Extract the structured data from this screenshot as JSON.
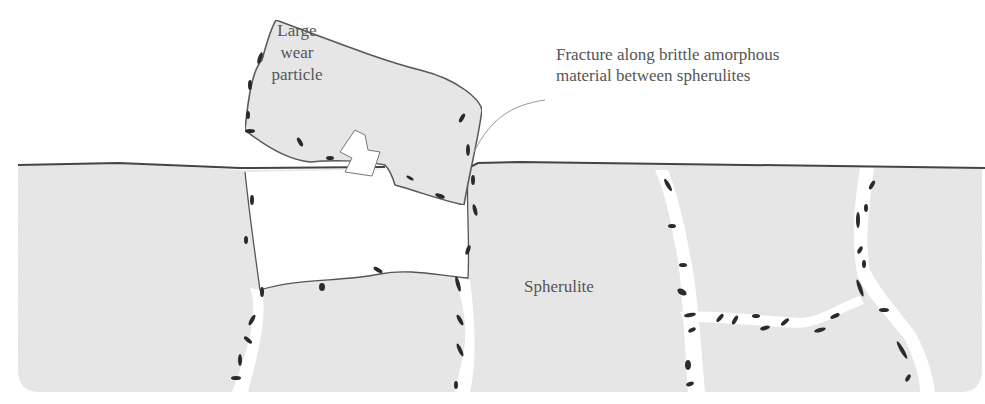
{
  "figure": {
    "colors": {
      "background": "#ffffff",
      "spherulite_fill": "#e9e9e9",
      "outline": "#444444",
      "amorphous_streaks": "#2a2a2a",
      "label_text": "#555555"
    }
  },
  "labels": {
    "particle": {
      "line1": "Large",
      "line2": "wear",
      "line3": "particle"
    },
    "fracture": {
      "line1": "Fracture along brittle amorphous",
      "line2": "material between spherulites"
    },
    "spherulite": "Spherulite"
  },
  "icons": {
    "arrow": "up-arrow-icon"
  }
}
